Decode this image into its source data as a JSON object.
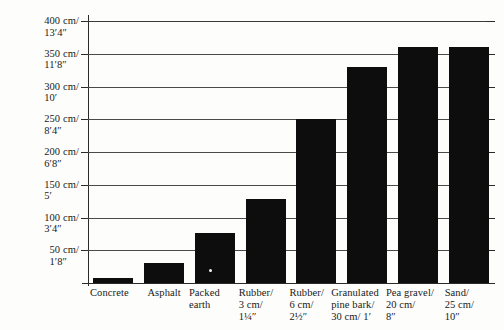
{
  "chart_data": {
    "type": "bar",
    "title": "",
    "subtitle": "",
    "xlabel": "",
    "ylabel": "",
    "ylim": [
      0,
      400
    ],
    "grid": true,
    "legend": null,
    "units_note": "cm / feet-inches",
    "y_ticks": [
      {
        "value": 400,
        "cm": "400 cm/",
        "imperial": "13′4″"
      },
      {
        "value": 350,
        "cm": "350 cm/",
        "imperial": "11′8″"
      },
      {
        "value": 300,
        "cm": "300 cm/",
        "imperial": "10′"
      },
      {
        "value": 250,
        "cm": "250 cm/",
        "imperial": "8′4″"
      },
      {
        "value": 200,
        "cm": "200 cm/",
        "imperial": "6′8″"
      },
      {
        "value": 150,
        "cm": "150 cm/",
        "imperial": "5′"
      },
      {
        "value": 100,
        "cm": "100 cm/",
        "imperial": "3′4″"
      },
      {
        "value": 50,
        "cm": "50 cm/",
        "imperial": "1′8″"
      }
    ],
    "categories": [
      "Concrete",
      "Asphalt",
      "Packed\nearth",
      "Rubber/\n3 cm/\n1¼″",
      "Rubber/\n6 cm/\n2½″",
      "Granulated\npine bark/\n30 cm/ 1′",
      "Pea gravel/\n20 cm/\n8″",
      "Sand/\n25 cm/\n10″"
    ],
    "values": [
      8,
      30,
      77,
      128,
      250,
      330,
      360,
      360
    ],
    "bar_color": "#0d0d0d",
    "background_color": "#fdfdfb",
    "axis_color": "#2a2a2a"
  }
}
